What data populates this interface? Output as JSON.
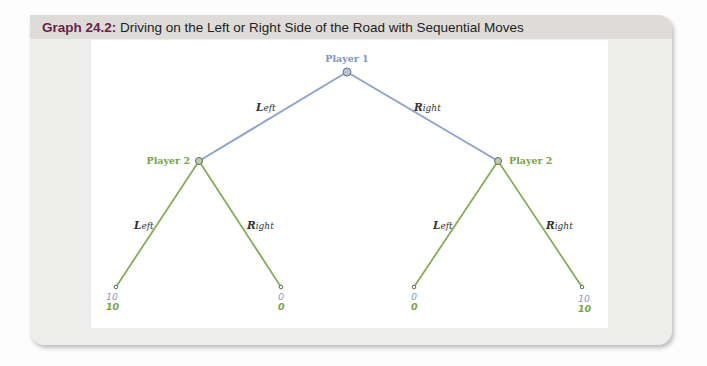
{
  "figure": {
    "number_label": "Graph 24.2:",
    "title": "Driving on the Left or Right Side of the Road with Sequential Moves"
  },
  "colors": {
    "player1": "#7d94c4",
    "player2": "#78a24a",
    "title_number": "#6b1f4a",
    "node_fill": "#b9c2c9"
  },
  "tree": {
    "root": {
      "label": "Player 1",
      "x": 347,
      "y": 72
    },
    "player2_nodes": [
      {
        "label": "Player 2",
        "x": 199,
        "y": 161
      },
      {
        "label": "Player 2",
        "x": 498,
        "y": 161
      }
    ],
    "moves": {
      "p1_left": {
        "cap": "L",
        "rest": "eft"
      },
      "p1_right": {
        "cap": "R",
        "rest": "ight"
      },
      "p2a_left": {
        "cap": "L",
        "rest": "eft"
      },
      "p2a_right": {
        "cap": "R",
        "rest": "ight"
      },
      "p2b_left": {
        "cap": "L",
        "rest": "eft"
      },
      "p2b_right": {
        "cap": "R",
        "rest": "ight"
      }
    },
    "leaves": [
      {
        "x": 116,
        "y": 287,
        "p1": "10",
        "p2": "10"
      },
      {
        "x": 281,
        "y": 287,
        "p1": "0",
        "p2": "0"
      },
      {
        "x": 414,
        "y": 287,
        "p1": "0",
        "p2": "0"
      },
      {
        "x": 582,
        "y": 287,
        "p1": "10",
        "p2": "10"
      }
    ]
  }
}
